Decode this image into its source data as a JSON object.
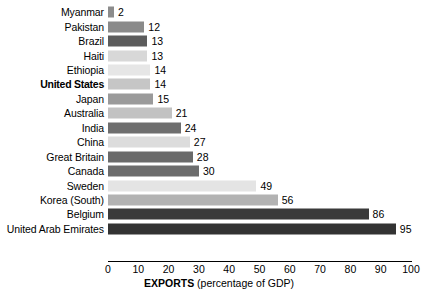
{
  "chart_data": {
    "type": "bar",
    "orientation": "horizontal",
    "title": "",
    "xlabel": "EXPORTS (percentage of GDP)",
    "xlabel_bold_part": "EXPORTS",
    "xlabel_plain_part": " (percentage of GDP)",
    "ylabel": "",
    "xlim": [
      0,
      100
    ],
    "xticks": [
      0,
      10,
      20,
      30,
      40,
      50,
      60,
      70,
      80,
      90,
      100
    ],
    "xtick_labels": [
      "0",
      "10",
      "20",
      "30",
      "40",
      "50",
      "60",
      "70",
      "80",
      "90",
      "100"
    ],
    "grid": false,
    "legend": "none",
    "categories": [
      "Myanmar",
      "Pakistan",
      "Brazil",
      "Haiti",
      "Ethiopia",
      "United States",
      "Japan",
      "Australia",
      "India",
      "China",
      "Great Britain",
      "Canada",
      "Sweden",
      "Korea (South)",
      "Belgium",
      "United Arab Emirates"
    ],
    "values": [
      2,
      12,
      13,
      13,
      14,
      14,
      15,
      21,
      24,
      27,
      28,
      30,
      49,
      56,
      86,
      95
    ],
    "value_labels": [
      "2",
      "12",
      "13",
      "13",
      "14",
      "14",
      "15",
      "21",
      "24",
      "27",
      "28",
      "30",
      "49",
      "56",
      "86",
      "95"
    ],
    "bar_colors": [
      "#8c8c8c",
      "#8a8a8a",
      "#5c5c5c",
      "#d8d8d8",
      "#e6e6e6",
      "#c6c6c6",
      "#9a9a9a",
      "#c2c2c2",
      "#6e6e6e",
      "#dcdcdc",
      "#6a6a6a",
      "#6c6c6c",
      "#e4e4e4",
      "#b2b2b2",
      "#3a3a3a",
      "#333333"
    ],
    "highlighted_category": "United States"
  }
}
